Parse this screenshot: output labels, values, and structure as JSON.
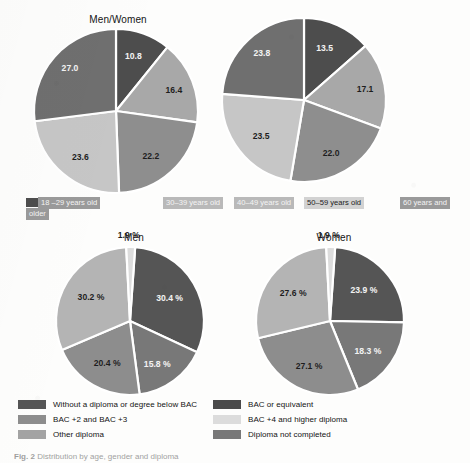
{
  "figure": {
    "caption_label": "Fig. 2",
    "caption_text": "Distribution by age, gender and diploma"
  },
  "charts": {
    "top_left": {
      "title": "Men/Women",
      "labels": [
        "10.8",
        "16.4",
        "22.2",
        "23.6",
        "27.0"
      ]
    },
    "top_right": {
      "title": "",
      "labels": [
        "13.5",
        "17.1",
        "22.0",
        "23.5",
        "23.8"
      ]
    },
    "bottom_left": {
      "title": "Men",
      "labels": [
        "30.4 %",
        "15.8 %",
        "20.4 %",
        "30.2 %",
        "1.9 %"
      ]
    },
    "bottom_right": {
      "title": "Women",
      "labels": [
        "23.9 %",
        "18.3 %",
        "27.1 %",
        "27.6 %",
        "1.9 %"
      ]
    }
  },
  "age_legend": {
    "items": [
      {
        "label": "18 –29 years old",
        "color": "#4d4d4d"
      },
      {
        "label": "30–39 years old",
        "color": "#8e8e8e"
      },
      {
        "label": "40–49 years old",
        "color": "#a8a8a8"
      },
      {
        "label": "50–59 years old",
        "color": "#c6c6c6"
      },
      {
        "label": "60 years and older",
        "color": "#6f6f6f"
      }
    ]
  },
  "diploma_legend": {
    "items": [
      {
        "label": "Without a diploma or degree below BAC",
        "color": "#555555"
      },
      {
        "label": "BAC or equivalent",
        "color": "#4a4a4a"
      },
      {
        "label": "BAC +2 and BAC +3",
        "color": "#8d8d8d"
      },
      {
        "label": "BAC +4 and higher diploma",
        "color": "#dcdcdc"
      },
      {
        "label": "Other diploma",
        "color": "#a3a3a3"
      },
      {
        "label": "Diploma not completed",
        "color": "#787878"
      }
    ]
  },
  "chart_data": [
    {
      "type": "pie",
      "title": "Men/Women",
      "categories": [
        "18 –29 years old",
        "30–39 years old",
        "40–49 years old",
        "50–59 years old",
        "60 years and older"
      ],
      "values": [
        10.8,
        16.4,
        22.2,
        23.6,
        27.0
      ],
      "colors": [
        "#4d4d4d",
        "#a8a8a8",
        "#8e8e8e",
        "#c6c6c6",
        "#6f6f6f"
      ],
      "unit": "%",
      "legend_position": "bottom"
    },
    {
      "type": "pie",
      "title": "",
      "categories": [
        "18 –29 years old",
        "30–39 years old",
        "40–49 years old",
        "50–59 years old",
        "60 years and older"
      ],
      "values": [
        13.5,
        17.1,
        22.0,
        23.5,
        23.8
      ],
      "colors": [
        "#4d4d4d",
        "#a8a8a8",
        "#8e8e8e",
        "#c6c6c6",
        "#6f6f6f"
      ],
      "unit": "%",
      "legend_position": "bottom"
    },
    {
      "type": "pie",
      "title": "Men",
      "categories": [
        "Without a diploma or degree below BAC",
        "BAC or equivalent",
        "BAC +2 and BAC +3",
        "Other diploma",
        "BAC +4 and higher diploma"
      ],
      "values": [
        30.4,
        15.8,
        20.4,
        30.2,
        1.9
      ],
      "colors": [
        "#555555",
        "#787878",
        "#8d8d8d",
        "#b4b4b4",
        "#dcdcdc"
      ],
      "unit": "%",
      "legend_position": "bottom"
    },
    {
      "type": "pie",
      "title": "Women",
      "categories": [
        "Without a diploma or degree below BAC",
        "BAC or equivalent",
        "BAC +2 and BAC +3",
        "Other diploma",
        "BAC +4 and higher diploma"
      ],
      "values": [
        23.9,
        18.3,
        27.1,
        27.6,
        1.9
      ],
      "colors": [
        "#555555",
        "#787878",
        "#8d8d8d",
        "#b4b4b4",
        "#dcdcdc"
      ],
      "unit": "%",
      "legend_position": "bottom"
    }
  ]
}
